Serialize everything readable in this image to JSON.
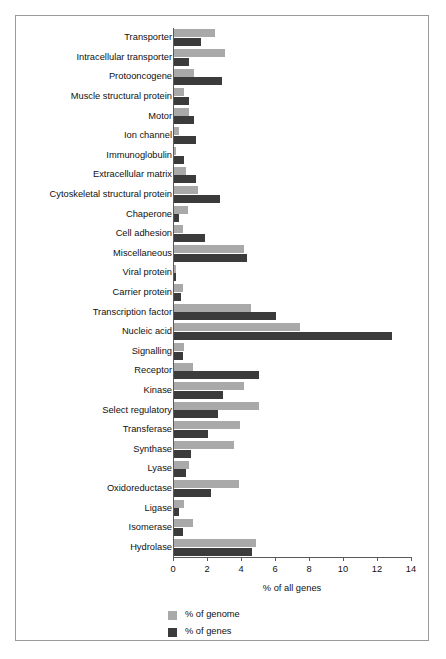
{
  "chart_data": {
    "type": "bar",
    "orientation": "horizontal",
    "title": "",
    "xlabel": "% of all genes",
    "ylabel": "",
    "xlim": [
      0,
      14
    ],
    "xticks": [
      0,
      2,
      4,
      6,
      8,
      10,
      12,
      14
    ],
    "xtick_labels": [
      "0",
      "2",
      "4",
      "6",
      "8",
      "10",
      "12",
      "14"
    ],
    "grid": false,
    "legend_position": "bottom-left",
    "categories": [
      "Transporter",
      "Intracellular transporter",
      "Protooncogene",
      "Muscle structural protein",
      "Motor",
      "Ion channel",
      "Immunoglobulin",
      "Extracellular matrix",
      "Cytoskeletal structural protein",
      "Chaperone",
      "Cell adhesion",
      "Miscellaneous",
      "Viral protein",
      "Carrier protein",
      "Transcription factor",
      "Nucleic acid",
      "Signalling",
      "Receptor",
      "Kinase",
      "Select regulatory",
      "Transferase",
      "Synthase",
      "Lyase",
      "Oxidoreductase",
      "Ligase",
      "Isomerase",
      "Hydrolase"
    ],
    "series": [
      {
        "name": "% of genome",
        "color": "#a9a9a9",
        "values": [
          2.4,
          3.0,
          1.2,
          0.6,
          0.9,
          0.3,
          0.1,
          0.7,
          1.4,
          0.8,
          0.5,
          4.1,
          0.1,
          0.5,
          4.5,
          7.4,
          0.6,
          1.1,
          4.1,
          5.0,
          3.9,
          3.5,
          0.9,
          3.8,
          0.6,
          1.1,
          4.8
        ],
        "unit": "%"
      },
      {
        "name": "% of genes",
        "color": "#3b3b3b",
        "values": [
          1.6,
          0.9,
          2.8,
          0.9,
          1.2,
          1.3,
          0.6,
          1.3,
          2.7,
          0.3,
          1.8,
          4.3,
          0.1,
          0.4,
          6.0,
          12.8,
          0.5,
          5.0,
          2.9,
          2.6,
          2.0,
          1.0,
          0.7,
          2.2,
          0.3,
          0.5,
          4.6
        ],
        "unit": "%"
      }
    ]
  },
  "axis": {
    "x_title": "% of all genes"
  },
  "legend": {
    "items": [
      {
        "label": "% of genome",
        "color": "#a9a9a9"
      },
      {
        "label": "% of genes",
        "color": "#3b3b3b"
      }
    ]
  },
  "colors": {
    "genome": "#a9a9a9",
    "genes": "#3b3b3b",
    "axis": "#5a5a5a",
    "frame": "#9a9a9a",
    "background": "#ffffff"
  }
}
